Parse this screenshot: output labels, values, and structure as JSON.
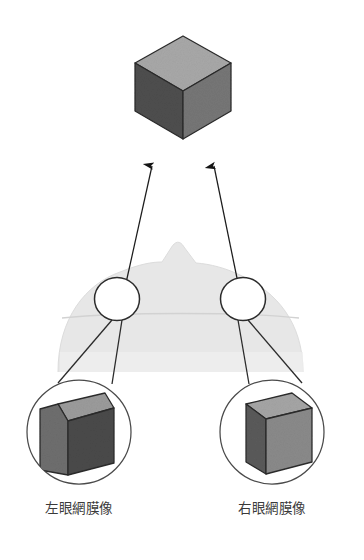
{
  "figure": {
    "background_color": "#ffffff",
    "width": 364,
    "height": 560
  },
  "stimulus": {
    "name": "gray-cube",
    "description": "立方体",
    "faces": {
      "top_color": "#a8a8a8",
      "left_color": "#4e4e4e",
      "right_color": "#767676",
      "edge_color": "#2b2b2b"
    }
  },
  "sight_lines": {
    "left_arrow_name": "left-eye-sight-line",
    "right_arrow_name": "right-eye-sight-line",
    "color": "#1c1c1c"
  },
  "head": {
    "name": "head-top-view",
    "fill_color": "#e7e7e7",
    "nose_label": "鼻"
  },
  "eyes": {
    "left": {
      "label": "左眼",
      "fill": "#ffffff",
      "stroke": "#2b2b2b"
    },
    "right": {
      "label": "右眼",
      "fill": "#ffffff",
      "stroke": "#2b2b2b"
    }
  },
  "retinal_views": [
    {
      "id": "left",
      "caption": "左眼網膜像",
      "circle_stroke": "#4a4a4a",
      "cube": {
        "top_color": "#9b9b9b",
        "front_color": "#4a4a4a",
        "side_color": "#6e6e6e",
        "edge_color": "#2b2b2b",
        "note": "左側面が広く見える"
      }
    },
    {
      "id": "right",
      "caption": "右眼網膜像",
      "circle_stroke": "#4a4a4a",
      "cube": {
        "top_color": "#a5a5a5",
        "front_color": "#8a8a8a",
        "side_color": "#5a5a5a",
        "edge_color": "#2b2b2b",
        "note": "右側面が広く見える"
      }
    }
  ],
  "captions": {
    "left": "左眼網膜像",
    "right": "右眼網膜像",
    "color": "#3a3a3a"
  }
}
